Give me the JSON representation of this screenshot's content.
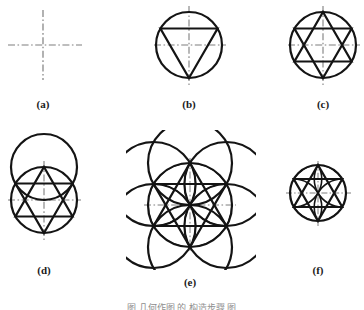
{
  "figure": {
    "domain": "geometric-construction-diagram",
    "background_color": "#ffffff",
    "stroke_color": "#141414",
    "centerline_color": "#8a8a8a",
    "caption_color": "#1a1a1a",
    "bottom_caption_text": "图  几何作图 的 构造步骤 图",
    "panels": [
      {
        "id": "a",
        "label": "(a)",
        "title": "center-lines",
        "center": [
          43,
          45
        ],
        "h_extent": [
          8,
          82
        ],
        "v_extent": [
          10,
          80
        ],
        "circle_radius": 0,
        "elements": [
          "horizontal-centerline",
          "vertical-centerline"
        ]
      },
      {
        "id": "b",
        "label": "(b)",
        "title": "circle-with-inscribed-triangle",
        "center": [
          189,
          45
        ],
        "circle_radius": 33,
        "elements": [
          "circle",
          "down-triangle",
          "centerlines"
        ],
        "triangle_vertices_deg": [
          90,
          210,
          330
        ]
      },
      {
        "id": "c",
        "label": "(c)",
        "title": "hexagram-in-circle",
        "center": [
          323,
          45
        ],
        "circle_radius": 33,
        "elements": [
          "circle",
          "up-triangle",
          "down-triangle",
          "centerlines"
        ]
      },
      {
        "id": "d",
        "label": "(d)",
        "title": "hexagram-with-offset-circle",
        "center": [
          44,
          200
        ],
        "circle_radius": 33,
        "offset_circle_center": [
          44,
          167
        ],
        "elements": [
          "circle",
          "offset-circle",
          "hexagram",
          "vesica-arcs",
          "centerlines"
        ]
      },
      {
        "id": "e",
        "label": "(e)",
        "title": "seed-of-life-with-hexagram",
        "center": [
          190,
          205
        ],
        "circle_radius": 42,
        "petal_count": 6,
        "elements": [
          "center-circle",
          "six-surrounding-circles",
          "hexagram",
          "vesica-petals",
          "centerlines"
        ]
      },
      {
        "id": "f",
        "label": "(f)",
        "title": "hexagram-with-petal-arcs",
        "center": [
          318,
          193
        ],
        "circle_radius": 28,
        "elements": [
          "circle",
          "hexagram",
          "vesica-petals",
          "centerlines"
        ]
      }
    ],
    "captions": [
      {
        "text": "(a)",
        "x": 13,
        "y": 98
      },
      {
        "text": "(b)",
        "x": 159,
        "y": 98
      },
      {
        "text": "(c)",
        "x": 293,
        "y": 98
      },
      {
        "text": "(d)",
        "x": 14,
        "y": 264
      },
      {
        "text": "(e)",
        "x": 160,
        "y": 276
      },
      {
        "text": "(f)",
        "x": 288,
        "y": 264
      }
    ]
  }
}
